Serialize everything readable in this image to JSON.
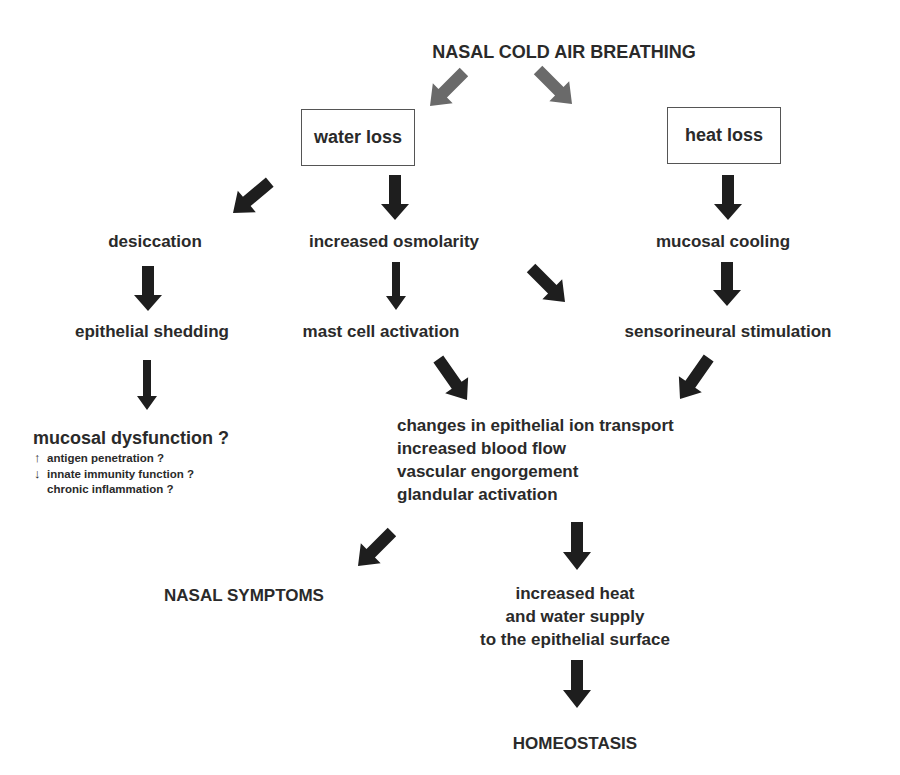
{
  "diagram": {
    "title": "NASAL COLD AIR BREATHING",
    "boxes": {
      "water_loss": "water loss",
      "heat_loss": "heat loss"
    },
    "nodes": {
      "desiccation": "desiccation",
      "increased_osmolarity": "increased osmolarity",
      "mucosal_cooling": "mucosal cooling",
      "epithelial_shedding": "epithelial shedding",
      "mast_cell_activation": "mast cell activation",
      "sensorineural_stimulation": "sensorineural stimulation",
      "mucosal_dysfunction": {
        "title": "mucosal dysfunction ?",
        "items": [
          {
            "arrow": "↑",
            "label": "antigen penetration ?"
          },
          {
            "arrow": "↓",
            "label": "innate immunity function ?"
          },
          {
            "arrow": "",
            "label": "chronic inflammation ?"
          }
        ]
      },
      "responses": [
        "changes in epithelial ion transport",
        "increased blood flow",
        "vascular engorgement",
        "glandular activation"
      ],
      "nasal_symptoms": "NASAL SYMPTOMS",
      "supply": [
        "increased heat",
        "and water supply",
        "to the epithelial surface"
      ],
      "homeostasis": "HOMEOSTASIS"
    },
    "colors": {
      "arrow_dark": "#1e1e1e",
      "arrow_gray": "#6a6a6a",
      "text": "#2a2a2a",
      "box_border": "#555555"
    }
  }
}
